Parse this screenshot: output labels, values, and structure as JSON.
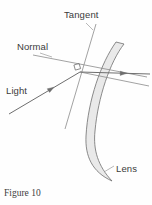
{
  "figure": {
    "caption": "Figure 10",
    "background_color": "#fefefe"
  },
  "labels": {
    "tangent": "Tangent",
    "normal": "Normal",
    "light": "Light",
    "lens": "Lens"
  },
  "colors": {
    "line": "#7a7a7a",
    "line_dark": "#5e5e5e",
    "lens_fill": "#e9e9e9",
    "lens_stroke": "#6e6e6e",
    "text": "#3b3b3b",
    "caption_text": "#404040"
  },
  "geometry": {
    "incidence_point": {
      "x": 80,
      "y": 72
    },
    "right_angle_marker": {
      "x": 77,
      "y": 64,
      "size": 6
    },
    "tangent_line": {
      "x1": 96,
      "y1": 24,
      "x2": 65,
      "y2": 129
    },
    "tangent_line_right": {
      "x1": 80,
      "y1": 72,
      "x2": 149,
      "y2": 86
    },
    "normal_line": {
      "x1": 33,
      "y1": 55,
      "x2": 147,
      "y2": 77
    },
    "incident_ray": {
      "x1": 9,
      "y1": 114,
      "x2": 80,
      "y2": 72
    },
    "refracted_ray": {
      "x1": 80,
      "y1": 72,
      "x2": 150,
      "y2": 74
    },
    "lens_top": {
      "x": 116,
      "y": 42
    },
    "lens_bottom": {
      "x": 112,
      "y": 181
    }
  }
}
